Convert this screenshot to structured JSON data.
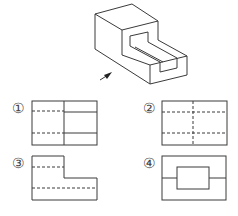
{
  "figure": {
    "type": "orthographic-projection-question",
    "isometric_view": {
      "description": "stepped block with rectangular slot",
      "view_arrow": "front view direction indicator"
    },
    "options": [
      {
        "label": "①",
        "description": "solid vertical center line; hidden dashed lines on left half, solid lines on right half"
      },
      {
        "label": "②",
        "description": "dashed vertical center line; two full-width dashed horizontal lines"
      },
      {
        "label": "③",
        "description": "L-shaped outline with two dashed horizontal lines"
      },
      {
        "label": "④",
        "description": "rectangle with inner rectangle and horizontal lines to edges"
      }
    ]
  }
}
